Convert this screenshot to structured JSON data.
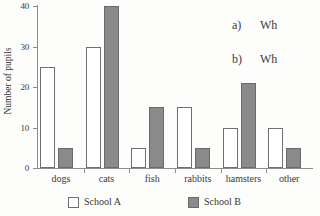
{
  "chart_data": {
    "type": "bar",
    "title": "",
    "xlabel": "",
    "ylabel": "Number of pupils",
    "ylim": [
      0,
      40
    ],
    "yticks": [
      0,
      10,
      20,
      30,
      40
    ],
    "grid": false,
    "legend_position": "bottom",
    "categories": [
      "dogs",
      "cats",
      "fish",
      "rabbits",
      "hamsters",
      "other"
    ],
    "series": [
      {
        "name": "School A",
        "color": "#ffffff",
        "values": [
          25,
          30,
          5,
          15,
          10,
          10
        ]
      },
      {
        "name": "School B",
        "color": "#8a8a8a",
        "values": [
          5,
          40,
          15,
          5,
          21,
          5
        ]
      }
    ]
  },
  "axis": {
    "y_title": "Number of pupils",
    "y_tick_labels": [
      "0",
      "10",
      "20",
      "30",
      "40"
    ],
    "x_tick_labels": [
      "dogs",
      "cats",
      "fish",
      "rabbits",
      "hamsters",
      "other"
    ]
  },
  "legend": {
    "items": [
      {
        "label": "School A",
        "swatch": "white-square-outline"
      },
      {
        "label": "School B",
        "swatch": "grey-filled-square"
      }
    ]
  },
  "questions": [
    {
      "marker": "a)",
      "text": "Wh"
    },
    {
      "marker": "b)",
      "text": "Wh"
    }
  ],
  "colors": {
    "school_a_fill": "#ffffff",
    "school_b_fill": "#8a8a8a",
    "bar_outline": "#6f6f6f",
    "axis": "#8d8d8d",
    "text": "#333333",
    "page_background": "#fdfdfb"
  }
}
